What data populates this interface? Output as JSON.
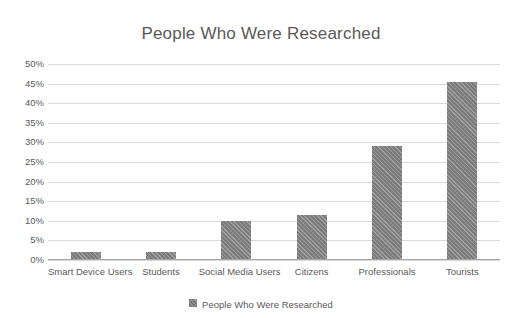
{
  "chart_data": {
    "type": "bar",
    "title": "People Who Were Researched",
    "xlabel": "",
    "ylabel": "",
    "categories": [
      "Smart Device Users",
      "Students",
      "Social Media Users",
      "Citizens",
      "Professionals",
      "Tourists"
    ],
    "values": [
      2,
      2,
      10,
      11.5,
      29,
      45.5
    ],
    "ylim": [
      0,
      50
    ],
    "yticks": [
      "0%",
      "5%",
      "10%",
      "15%",
      "20%",
      "25%",
      "30%",
      "35%",
      "40%",
      "45%",
      "50%"
    ],
    "ytick_values": [
      0,
      5,
      10,
      15,
      20,
      25,
      30,
      35,
      40,
      45,
      50
    ],
    "grid": true,
    "legend": {
      "position": "bottom",
      "entries": [
        {
          "label": "People Who Were Researched",
          "color": "#7b7b7b"
        }
      ]
    },
    "series": [
      {
        "name": "People Who Were Researched",
        "color": "#7b7b7b",
        "values": [
          2,
          2,
          10,
          11.5,
          29,
          45.5
        ]
      }
    ]
  }
}
